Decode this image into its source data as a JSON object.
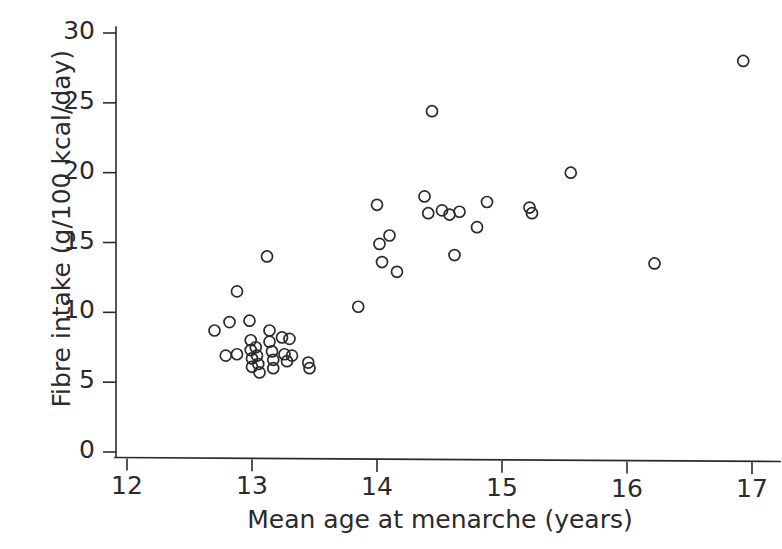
{
  "figure": {
    "kind": "scatter-plot",
    "background": "#ffffff",
    "ink_color": "#2b2b2b"
  },
  "chart_data": {
    "type": "scatter",
    "title": "",
    "xlabel": "Mean age at menarche (years)",
    "ylabel": "Fibre intake (g/100 kcal/day)",
    "xlim": [
      11.9,
      17.2
    ],
    "ylim": [
      0,
      31.5
    ],
    "xticks": [
      12,
      13,
      14,
      15,
      16,
      17
    ],
    "xticklabels": [
      "12",
      "13",
      "14",
      "15",
      "16",
      "17"
    ],
    "yticks": [
      0,
      5,
      10,
      15,
      20,
      25,
      30
    ],
    "yticklabels": [
      "0",
      "5",
      "10",
      "15",
      "20",
      "25",
      "30"
    ],
    "grid": false,
    "legend": null,
    "marker": {
      "shape": "circle",
      "filled": false,
      "edge_color": "#2b2b2b",
      "size_px": 11
    },
    "n_points": 46,
    "series": [
      {
        "name": "countries",
        "points": [
          [
            12.7,
            8.7
          ],
          [
            12.82,
            9.3
          ],
          [
            12.88,
            11.5
          ],
          [
            12.88,
            7.0
          ],
          [
            12.79,
            6.9
          ],
          [
            12.98,
            9.4
          ],
          [
            12.99,
            8.0
          ],
          [
            12.99,
            7.3
          ],
          [
            13.0,
            6.7
          ],
          [
            13.0,
            6.1
          ],
          [
            13.03,
            7.5
          ],
          [
            13.04,
            6.9
          ],
          [
            13.05,
            6.3
          ],
          [
            13.06,
            5.7
          ],
          [
            13.12,
            14.0
          ],
          [
            13.14,
            8.7
          ],
          [
            13.14,
            7.9
          ],
          [
            13.16,
            7.2
          ],
          [
            13.17,
            6.6
          ],
          [
            13.17,
            6.0
          ],
          [
            13.24,
            8.2
          ],
          [
            13.26,
            7.0
          ],
          [
            13.28,
            6.5
          ],
          [
            13.3,
            8.1
          ],
          [
            13.32,
            6.9
          ],
          [
            13.45,
            6.4
          ],
          [
            13.46,
            6.0
          ],
          [
            13.85,
            10.4
          ],
          [
            14.0,
            17.7
          ],
          [
            14.02,
            14.9
          ],
          [
            14.04,
            13.6
          ],
          [
            14.1,
            15.5
          ],
          [
            14.16,
            12.9
          ],
          [
            14.38,
            18.3
          ],
          [
            14.41,
            17.1
          ],
          [
            14.44,
            24.4
          ],
          [
            14.52,
            17.3
          ],
          [
            14.58,
            17.0
          ],
          [
            14.62,
            14.1
          ],
          [
            14.66,
            17.2
          ],
          [
            14.8,
            16.1
          ],
          [
            14.88,
            17.9
          ],
          [
            15.22,
            17.5
          ],
          [
            15.24,
            17.1
          ],
          [
            15.55,
            20.0
          ],
          [
            16.22,
            13.5
          ],
          [
            16.93,
            28.0
          ]
        ]
      }
    ]
  }
}
